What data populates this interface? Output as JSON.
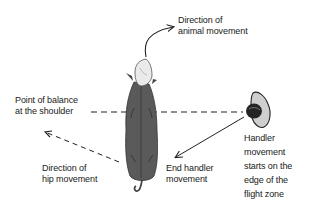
{
  "diagram": {
    "title": "",
    "labels": {
      "animal_direction": [
        "Direction of",
        "animal movement"
      ],
      "balance_point": [
        "Point of balance",
        "at the shoulder"
      ],
      "hip_direction": [
        "Direction of",
        "hip movement"
      ],
      "end_handler": [
        "End handler",
        "movement"
      ],
      "handler_start": [
        "Handler",
        "movement",
        "starts on the",
        "edge of the",
        "flight zone"
      ]
    },
    "colors": {
      "cow_body": "#5a5a5a",
      "cow_head": "#e8e8e8",
      "handler_head": "#2a2a2a",
      "handler_shoulders": "#c8c8c8",
      "lines": "#222222",
      "text": "#1a1a1a"
    },
    "figures": [
      "cow-top-view",
      "handler-top-view"
    ],
    "arrows": [
      "animal-movement-arrow",
      "hip-movement-arrow",
      "handler-path-arrow"
    ],
    "dashed_lines": [
      "balance-point-line"
    ]
  }
}
